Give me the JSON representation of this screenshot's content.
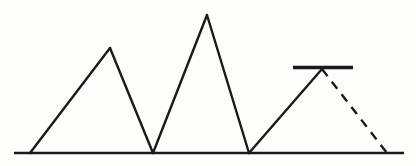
{
  "figure": {
    "title": "",
    "background_color": "#fdfdfc",
    "stroke_color": "#1a1a1a",
    "width": 416,
    "height": 166,
    "baseline": {
      "label": "baseline",
      "x1": 14,
      "y1": 153,
      "x2": 404,
      "y2": 153,
      "stroke_width": 2.6
    },
    "peaks": [
      {
        "label": "peak-1",
        "left_x": 30,
        "apex_x": 110,
        "apex_y": 48,
        "right_x": 153,
        "style": "solid",
        "height": 105
      },
      {
        "label": "peak-2",
        "left_x": 153,
        "apex_x": 207,
        "apex_y": 15,
        "right_x": 249,
        "style": "solid",
        "height": 138
      },
      {
        "label": "peak-3",
        "left_x": 249,
        "apex_x": 322,
        "apex_y": 69,
        "right_x": 387,
        "style": "solid-left-dashed-right",
        "height": 84
      }
    ],
    "cap_bar": {
      "label": "cap-bar",
      "x1": 293,
      "y1": 67.5,
      "x2": 353,
      "y2": 67.5,
      "stroke_width": 3.4
    },
    "dashed_edge": {
      "label": "dashed-right-edge",
      "x1": 322,
      "y1": 69,
      "x2": 387,
      "y2": 153,
      "stroke_width": 2.4,
      "dash_pattern": "9 7"
    },
    "stroke_widths": {
      "peak_edge": 2.4
    }
  }
}
